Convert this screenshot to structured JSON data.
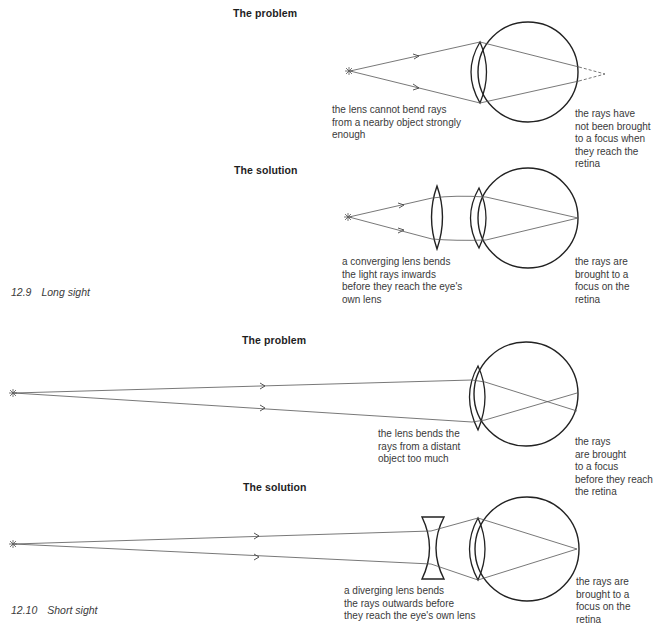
{
  "figures": [
    {
      "caption_number": "12.9",
      "caption_title": "Long sight",
      "problem": {
        "heading": "The problem",
        "note_left": "the lens cannot bend rays\nfrom a nearby object strongly\nenough",
        "note_right": "the rays have\nnot been brought\nto a focus when\nthey reach the\nretina"
      },
      "solution": {
        "heading": "The solution",
        "note_left": "a converging lens bends\nthe light rays inwards\nbefore they reach the eye's\nown lens",
        "note_right": "the rays are\nbrought to a\nfocus on the\nretina"
      }
    },
    {
      "caption_number": "12.10",
      "caption_title": "Short sight",
      "problem": {
        "heading": "The problem",
        "note_left": "the lens bends the\nrays from a distant\nobject too much",
        "note_right": "the rays\nare brought\nto a focus\nbefore they reach\nthe retina"
      },
      "solution": {
        "heading": "The solution",
        "note_left": "a diverging lens bends\nthe rays outwards before\nthey reach the eye's own lens",
        "note_right": "the rays are\nbrought to a\nfocus on the\nretina"
      }
    }
  ],
  "colors": {
    "line": "#2b2b2b",
    "ray": "#555555",
    "text": "#3a3a3a"
  }
}
